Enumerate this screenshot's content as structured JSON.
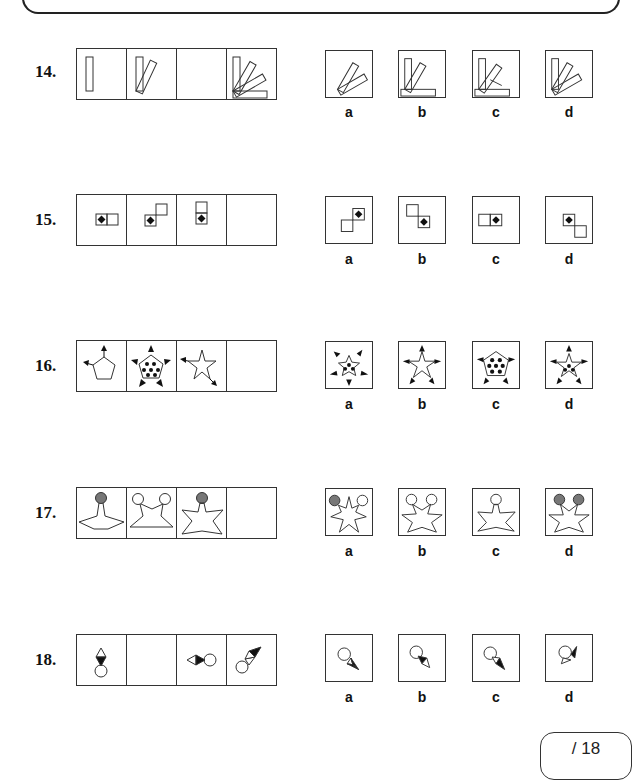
{
  "questions": [
    {
      "number": "14.",
      "options": [
        "a",
        "b",
        "c",
        "d"
      ],
      "sequence_cells": 4,
      "missing_index": 2,
      "theme": "rotating-rectangles"
    },
    {
      "number": "15.",
      "options": [
        "a",
        "b",
        "c",
        "d"
      ],
      "sequence_cells": 4,
      "missing_index": 3,
      "theme": "squares-with-diamond"
    },
    {
      "number": "16.",
      "options": [
        "a",
        "b",
        "c",
        "d"
      ],
      "sequence_cells": 4,
      "missing_index": 3,
      "theme": "stars-and-arrows"
    },
    {
      "number": "17.",
      "options": [
        "a",
        "b",
        "c",
        "d"
      ],
      "sequence_cells": 4,
      "missing_index": 3,
      "theme": "stars-with-circles"
    },
    {
      "number": "18.",
      "options": [
        "a",
        "b",
        "c",
        "d"
      ],
      "sequence_cells": 4,
      "missing_index": 1,
      "theme": "circle-and-triangles"
    }
  ],
  "score": {
    "label": "/ 18"
  },
  "colors": {
    "line": "#333333",
    "fill_grey": "#777777",
    "fill_black": "#111111"
  }
}
